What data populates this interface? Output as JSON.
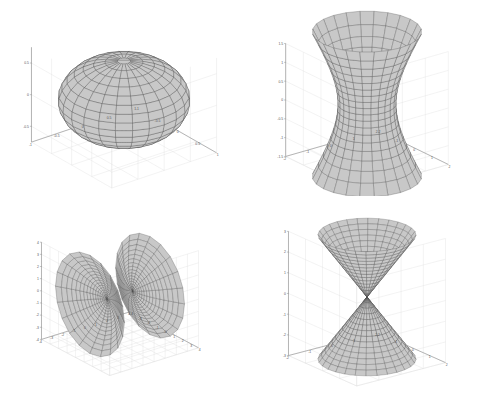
{
  "figure": {
    "title": "",
    "background_color": "#ffffff",
    "layout": "2x2 subplot grid",
    "width": 485,
    "height": 393,
    "style": {
      "mesh_line_color": "#404040",
      "surface_fill_color": "#c8c8c8",
      "grid_color": "#dcdcdc",
      "axis_line_color": "#808080",
      "tick_label_color": "#555555",
      "axis_box": "back-walls + floor (MATLAB default 3-D box)"
    }
  },
  "chart_data": [
    {
      "type": "surface",
      "id": "ellipsoid",
      "position": "top-left",
      "title": "",
      "equation": "x^2/a^2 + y^2/b^2 + z^2/c^2 = 1",
      "surface_name": "Ellipsoid",
      "xlabel": "",
      "ylabel": "",
      "zlabel": "",
      "xlim": [
        -1,
        1
      ],
      "ylim": [
        -1,
        1
      ],
      "zlim": [
        -0.75,
        0.75
      ],
      "xticks": [
        1,
        0.5,
        0,
        -0.5,
        -1
      ],
      "xticklabels": [
        "1",
        "0.5",
        "0",
        "-0.5",
        "-1"
      ],
      "yticks": [
        -1,
        -0.5,
        0,
        0.5,
        1
      ],
      "yticklabels": [
        "-1",
        "-0.5",
        "0",
        "0.5",
        "1"
      ],
      "zticks": [
        0.5,
        0,
        -0.5
      ],
      "zticklabels": [
        "0.5",
        "0",
        "-0.5"
      ],
      "semi_axes": {
        "a": 1,
        "b": 1,
        "c": 0.62
      },
      "mesh_u_lines": 24,
      "mesh_v_lines": 16,
      "grid": true,
      "legend": null,
      "notes": "Oblate spheroid, flattened on z-axis; dark dense mesh at the north pole"
    },
    {
      "type": "surface",
      "id": "hyperboloid-one-sheet",
      "position": "top-right",
      "title": "",
      "equation": "x^2/a^2 + y^2/b^2 - z^2/c^2 = 1",
      "surface_name": "Hyperboloid of one sheet",
      "xlabel": "",
      "ylabel": "",
      "zlabel": "",
      "xlim": [
        -2,
        2
      ],
      "ylim": [
        -2,
        2
      ],
      "zlim": [
        -1.5,
        1.5
      ],
      "xticks": [
        2,
        1,
        0,
        -1,
        -2
      ],
      "xticklabels": [
        "2",
        "1",
        "0",
        "-1",
        "-2"
      ],
      "yticks": [
        -2,
        -1,
        0,
        1,
        2
      ],
      "yticklabels": [
        "-2",
        "-1",
        "0",
        "1",
        "2"
      ],
      "zticks": [
        1.5,
        1,
        0.5,
        0,
        -0.5,
        -1,
        -1.5
      ],
      "zticklabels": [
        "1.5",
        "1",
        "0.5",
        "0",
        "-0.5",
        "-1",
        "-1.5"
      ],
      "waist_radius": 1,
      "top_radius": 1.8,
      "mesh_u_lines": 24,
      "mesh_v_lines": 18,
      "grid": true,
      "legend": null,
      "notes": "Single connected saddle/waisted surface, narrowest at z = 0"
    },
    {
      "type": "surface",
      "id": "hyperboloid-two-sheets",
      "position": "bottom-left",
      "title": "",
      "equation": "x^2/a^2 - y^2/b^2 - z^2/c^2 = 1",
      "surface_name": "Hyperboloid of two sheets",
      "xlabel": "",
      "ylabel": "",
      "zlabel": "",
      "xlim": [
        -4,
        4
      ],
      "ylim": [
        -4,
        4
      ],
      "zlim": [
        -4,
        4
      ],
      "xticks": [
        4,
        3,
        2,
        1,
        0,
        -1,
        -2,
        -3,
        -4
      ],
      "xticklabels": [
        "4",
        "3",
        "2",
        "1",
        "0",
        "-1",
        "-2",
        "-3",
        "-4"
      ],
      "yticks": [
        -4,
        -3,
        -2,
        -1,
        0,
        1,
        2,
        3,
        4
      ],
      "yticklabels": [
        "-4",
        "-3",
        "-2",
        "-1",
        "0",
        "1",
        "2",
        "3",
        "4"
      ],
      "zticks": [
        4,
        3,
        2,
        1,
        0,
        -1,
        -2,
        -3,
        -4
      ],
      "zticklabels": [
        "4",
        "3",
        "2",
        "1",
        "0",
        "-1",
        "-2",
        "-3",
        "-4"
      ],
      "sheets": 2,
      "vertex_separation": 2,
      "mesh_u_lines": 20,
      "mesh_v_lines": 16,
      "grid": true,
      "legend": null,
      "notes": "Two disconnected bowl-shaped sheets opening away from each other along the horizontal axis"
    },
    {
      "type": "surface",
      "id": "elliptic-cone",
      "position": "bottom-right",
      "title": "",
      "equation": "x^2/a^2 + y^2/b^2 - z^2/c^2 = 0",
      "surface_name": "Elliptic cone (double cone)",
      "xlabel": "",
      "ylabel": "",
      "zlabel": "",
      "xlim": [
        -2,
        2
      ],
      "ylim": [
        -2,
        2
      ],
      "zlim": [
        -3,
        3
      ],
      "xticks": [
        2,
        1,
        0,
        -1,
        -2
      ],
      "xticklabels": [
        "2",
        "1",
        "0",
        "-1",
        "-2"
      ],
      "yticks": [
        -2,
        -1,
        0,
        1,
        2
      ],
      "yticklabels": [
        "-2",
        "-1",
        "0",
        "1",
        "2"
      ],
      "zticks": [
        3,
        2,
        1,
        0,
        -1,
        -2,
        -3
      ],
      "zticklabels": [
        "3",
        "2",
        "1",
        "0",
        "-1",
        "-2",
        "-3"
      ],
      "apex": [
        0,
        0,
        0
      ],
      "half_angle_deg": 34,
      "mesh_u_lines": 28,
      "mesh_v_lines": 14,
      "grid": true,
      "legend": null,
      "notes": "Two nappes meeting at the origin; upper nappe opens up, lower nappe opens down"
    }
  ]
}
